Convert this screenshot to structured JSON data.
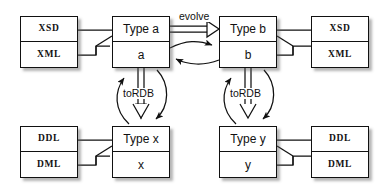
{
  "diagram": {
    "background_color": "#ffffff",
    "line_color": "#111111",
    "nodes": [
      {
        "id": "xsd-xml-left",
        "name": "schema-box-left",
        "top_label": "XSD",
        "bottom_label": "XML",
        "style": "mono",
        "x": 20,
        "y": 16,
        "w": 58,
        "h": 52
      },
      {
        "id": "type-a",
        "name": "type-a-box",
        "top_label": "Type a",
        "bottom_label": "a",
        "style": "type",
        "x": 112,
        "y": 16,
        "w": 58,
        "h": 52
      },
      {
        "id": "type-b",
        "name": "type-b-box",
        "top_label": "Type b",
        "bottom_label": "b",
        "style": "type",
        "x": 219,
        "y": 16,
        "w": 58,
        "h": 52
      },
      {
        "id": "xsd-xml-right",
        "name": "schema-box-right",
        "top_label": "XSD",
        "bottom_label": "XML",
        "style": "mono",
        "x": 311,
        "y": 16,
        "w": 58,
        "h": 52
      },
      {
        "id": "ddl-dml-left",
        "name": "relational-box-left",
        "top_label": "DDL",
        "bottom_label": "DML",
        "style": "mono",
        "x": 20,
        "y": 126,
        "w": 58,
        "h": 52
      },
      {
        "id": "type-x",
        "name": "type-x-box",
        "top_label": "Type x",
        "bottom_label": "x",
        "style": "type",
        "x": 112,
        "y": 126,
        "w": 58,
        "h": 52
      },
      {
        "id": "type-y",
        "name": "type-y-box",
        "top_label": "Type y",
        "bottom_label": "y",
        "style": "type",
        "x": 219,
        "y": 126,
        "w": 58,
        "h": 52
      },
      {
        "id": "ddl-dml-right",
        "name": "relational-box-right",
        "top_label": "DDL",
        "bottom_label": "DML",
        "style": "mono",
        "x": 311,
        "y": 126,
        "w": 58,
        "h": 52
      }
    ],
    "edge_labels": [
      {
        "id": "evolve",
        "name": "evolve-label",
        "text": "evolve",
        "x": 178,
        "y": 11
      },
      {
        "id": "torbd-left",
        "name": "to-rdb-label-left",
        "text": "toRDB",
        "x": 124,
        "y": 88
      },
      {
        "id": "torbd-right",
        "name": "to-rdb-label-right",
        "text": "toRDB",
        "x": 231,
        "y": 88
      }
    ],
    "edges": [
      {
        "id": "evolve-arrow",
        "name": "evolve-arrow",
        "from": "type-a",
        "to": "type-b",
        "kind": "hollow-triangle",
        "label": "evolve"
      },
      {
        "id": "a-to-b-curve",
        "name": "a-to-b-curved-arrow",
        "from": "type-a",
        "to": "type-b",
        "kind": "curved-solid-arrow"
      },
      {
        "id": "b-to-a-curve",
        "name": "b-to-a-curved-arrow",
        "from": "type-b",
        "to": "type-a",
        "kind": "curved-solid-arrow"
      },
      {
        "id": "a-to-x",
        "name": "to-rdb-arrow-left",
        "from": "type-a",
        "to": "type-x",
        "kind": "hollow-triangle",
        "label": "toRDB"
      },
      {
        "id": "x-to-a-curve",
        "name": "x-to-a-curved-arrow",
        "from": "type-x",
        "to": "type-a",
        "kind": "curved-solid-arrow"
      },
      {
        "id": "a-to-x-curve",
        "name": "a-to-x-curved-arrow",
        "from": "type-a",
        "to": "type-x",
        "kind": "curved-solid-arrow"
      },
      {
        "id": "b-to-y",
        "name": "to-rdb-arrow-right",
        "from": "type-b",
        "to": "type-y",
        "kind": "hollow-triangle",
        "label": "toRDB"
      },
      {
        "id": "y-to-b-curve",
        "name": "y-to-b-curved-arrow",
        "from": "type-y",
        "to": "type-b",
        "kind": "curved-solid-arrow"
      },
      {
        "id": "b-to-y-curve",
        "name": "b-to-y-curved-arrow",
        "from": "type-b",
        "to": "type-y",
        "kind": "curved-solid-arrow"
      },
      {
        "id": "xsdl-a",
        "name": "schema-left-to-type-a-connector",
        "from": "xsd-xml-left",
        "to": "type-a",
        "kind": "plain-line"
      },
      {
        "id": "b-xsdr",
        "name": "type-b-to-schema-right-connector",
        "from": "type-b",
        "to": "xsd-xml-right",
        "kind": "plain-line"
      },
      {
        "id": "ddll-x",
        "name": "relational-left-to-type-x-connector",
        "from": "ddl-dml-left",
        "to": "type-x",
        "kind": "plain-line"
      },
      {
        "id": "y-ddlr",
        "name": "type-y-to-relational-right-connector",
        "from": "type-y",
        "to": "ddl-dml-right",
        "kind": "plain-line"
      }
    ]
  }
}
